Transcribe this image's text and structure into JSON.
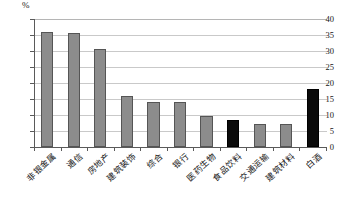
{
  "chart_data": {
    "type": "bar",
    "title": "",
    "xlabel": "",
    "ylabel": "%",
    "unit": "%",
    "ylim": [
      0,
      40
    ],
    "ytick_step": 5,
    "yticks": [
      "0",
      "5",
      "10",
      "15",
      "20",
      "25",
      "30",
      "35",
      "40"
    ],
    "grid": true,
    "legend": "none",
    "categories": [
      "非银金属",
      "通信",
      "房地产",
      "建筑装饰",
      "综合",
      "银行",
      "医药生物",
      "食品饮料",
      "交通运输",
      "建筑材料",
      "白酒"
    ],
    "values": [
      36.0,
      35.5,
      30.5,
      16.0,
      14.0,
      14.0,
      9.7,
      8.5,
      7.3,
      7.3,
      18.0
    ],
    "highlighted": [
      "食品饮料",
      "白酒"
    ],
    "colors": {
      "bar": "#8c8c8c",
      "bar_highlight": "#0b0b0b",
      "bar_border": "#555555",
      "axis": "#5a5a5a",
      "grid": "#c9c9c9",
      "text": "#151515",
      "background": "#ffffff"
    }
  }
}
